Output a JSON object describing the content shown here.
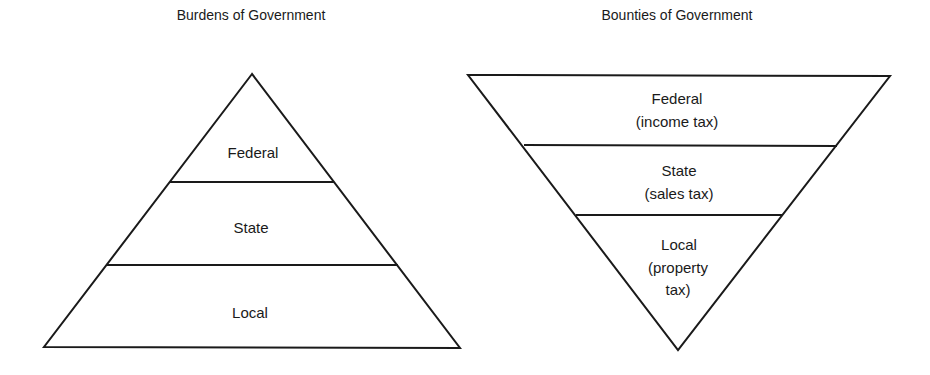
{
  "diagrams": [
    {
      "title": "Burdens of Government",
      "shape": "pyramid",
      "levels": [
        {
          "lines": [
            "Federal"
          ]
        },
        {
          "lines": [
            "State"
          ]
        },
        {
          "lines": [
            "Local"
          ]
        }
      ]
    },
    {
      "title": "Bounties of Government",
      "shape": "inverted-pyramid",
      "levels": [
        {
          "lines": [
            "Federal",
            "(income tax)"
          ]
        },
        {
          "lines": [
            "State",
            "(sales tax)"
          ]
        },
        {
          "lines": [
            "Local",
            "(property",
            "tax)"
          ]
        }
      ]
    }
  ],
  "colors": {
    "stroke": "#1a1a1a",
    "background": "#ffffff"
  }
}
